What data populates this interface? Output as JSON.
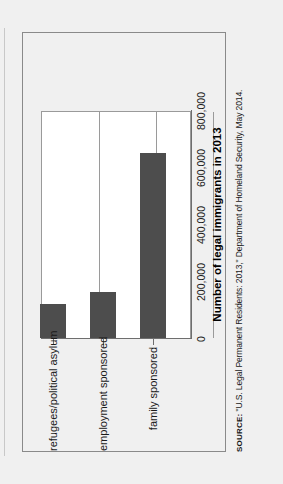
{
  "figure": {
    "source_kicker": "SOURCE:",
    "source_text": " \"U.S. Legal Permanent Residents: 2013,\" Department of Homeland Security, May 2014."
  },
  "chart_data": {
    "type": "bar",
    "orientation": "vertical",
    "title": "",
    "subtitle": "",
    "categories": [
      "refugees/political asylum",
      "employment sponsored",
      "family sponsored"
    ],
    "values": [
      119000,
      161000,
      649000
    ],
    "series": [
      {
        "name": "Number of legal immigrants in 2013",
        "values": [
          119000,
          161000,
          649000
        ]
      }
    ],
    "xlabel": "",
    "ylabel": "Number of legal immigrants in 2013",
    "value_axis_title": "Number of legal immigrants in 2013",
    "ylim": [
      0,
      800000
    ],
    "ticks": [
      0,
      200000,
      400000,
      600000,
      800000
    ],
    "tick_labels": [
      "0",
      "200,000",
      "400,000",
      "600,000",
      "800,000"
    ],
    "grid": true,
    "grid_axis": "value",
    "legend": false,
    "legend_position": "none",
    "bar_color": "#4d4d4d",
    "plot_background": "#ffffff",
    "figure_background": "#f0f0f0",
    "gridline_color": "#9a9a9a",
    "axis_color": "#6e6e6e",
    "rotation_degrees": -90
  }
}
